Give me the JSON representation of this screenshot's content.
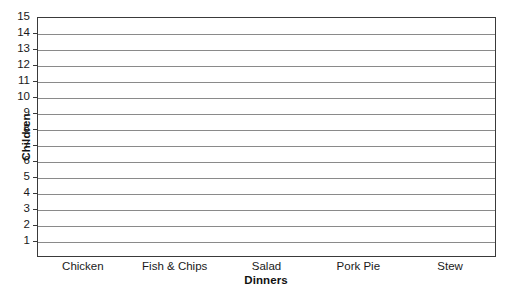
{
  "clipped_top_text": "",
  "chart_data": {
    "type": "bar",
    "title": "",
    "xlabel": "Dinners",
    "ylabel": "Children",
    "categories": [
      "Chicken",
      "Fish & Chips",
      "Salad",
      "Pork Pie",
      "Stew"
    ],
    "values": [
      null,
      null,
      null,
      null,
      null
    ],
    "ylim": [
      0,
      15
    ],
    "ytick_labels": [
      "1",
      "2",
      "3",
      "4",
      "5",
      "6",
      "7",
      "8",
      "9",
      "10",
      "11",
      "12",
      "13",
      "14",
      "15"
    ],
    "grid": "horizontal",
    "legend": "none",
    "note": "blank grid template - no bars drawn",
    "colors": {
      "axis": "#3a3a3a",
      "gridline": "#8a8a8a",
      "text": "#1a1a1a",
      "plot_background": "#ffffff"
    }
  }
}
